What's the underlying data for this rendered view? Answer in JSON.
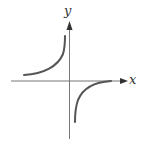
{
  "diagram": {
    "type": "function-graph",
    "axes": {
      "x_label": "x",
      "y_label": "y"
    },
    "colors": {
      "axis": "#777777",
      "curve": "#555555",
      "label": "#333333",
      "background": "#ffffff"
    },
    "branches": [
      {
        "name": "upper-left-branch",
        "quadrant": "II"
      },
      {
        "name": "lower-right-branch",
        "quadrant": "IV"
      }
    ]
  }
}
